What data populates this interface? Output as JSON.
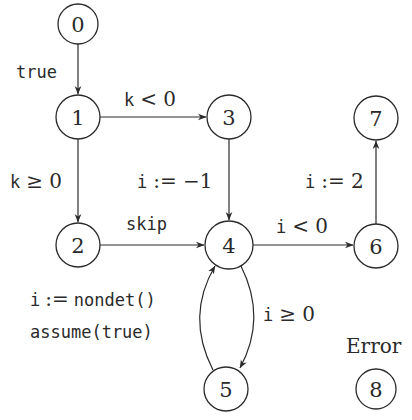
{
  "diagram": {
    "type": "control-flow-graph",
    "nodes": [
      {
        "id": "0",
        "label": "0",
        "cx": 78,
        "cy": 24,
        "r": 20
      },
      {
        "id": "1",
        "label": "1",
        "cx": 78,
        "cy": 117,
        "r": 22
      },
      {
        "id": "2",
        "label": "2",
        "cx": 78,
        "cy": 245,
        "r": 22
      },
      {
        "id": "3",
        "label": "3",
        "cx": 229,
        "cy": 117,
        "r": 22
      },
      {
        "id": "4",
        "label": "4",
        "cx": 229,
        "cy": 245,
        "r": 24
      },
      {
        "id": "5",
        "label": "5",
        "cx": 226,
        "cy": 389,
        "r": 22
      },
      {
        "id": "6",
        "label": "6",
        "cx": 376,
        "cy": 246,
        "r": 22
      },
      {
        "id": "7",
        "label": "7",
        "cx": 376,
        "cy": 118,
        "r": 22
      },
      {
        "id": "8",
        "label": "8",
        "cx": 376,
        "cy": 389,
        "r": 20
      }
    ],
    "edges": [
      {
        "from": "0",
        "to": "1",
        "label": "true"
      },
      {
        "from": "1",
        "to": "3",
        "label": "k < 0"
      },
      {
        "from": "1",
        "to": "2",
        "label": "k ≥ 0"
      },
      {
        "from": "3",
        "to": "4",
        "label": "i := −1"
      },
      {
        "from": "2",
        "to": "4",
        "label": "skip"
      },
      {
        "from": "4",
        "to": "6",
        "label": "i < 0"
      },
      {
        "from": "6",
        "to": "7",
        "label": "i := 2"
      },
      {
        "from": "4",
        "to": "5",
        "label": "i ≥ 0"
      },
      {
        "from": "5",
        "to": "4",
        "label_line1": "i := nondet()",
        "label_line2": "assume(true)"
      }
    ],
    "annotations": {
      "error_label": "Error"
    },
    "labels": {
      "e01": "true",
      "e13": "k < 0",
      "e12_k": "k",
      "e12_rest": "≥ 0",
      "e34_i": "i",
      "e34_rest": ":= −1",
      "e24": "skip",
      "e46_i": "i",
      "e46_rest": "< 0",
      "e67_i": "i",
      "e67_rest": ":= 2",
      "e45_i": "i",
      "e45_rest": "≥ 0",
      "e54_i": "i",
      "e54_assign": ":=",
      "e54_nondet": "nondet()",
      "e54_assume": "assume(true)"
    },
    "colors": {
      "stroke": "#2a2a2a",
      "background": "#ffffff"
    }
  }
}
